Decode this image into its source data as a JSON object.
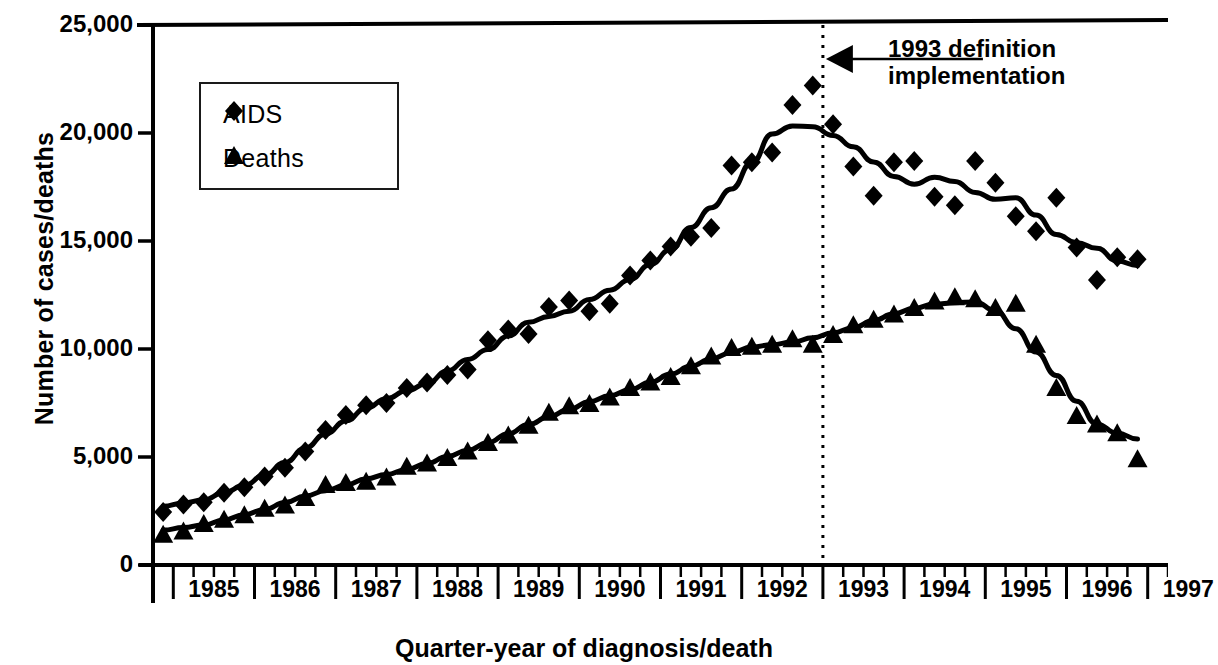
{
  "chart_data": {
    "type": "scatter",
    "title": "",
    "xlabel": "Quarter-year of diagnosis/death",
    "ylabel": "Number of cases/deaths",
    "ylim": [
      0,
      25000
    ],
    "yticks": [
      0,
      5000,
      10000,
      15000,
      20000,
      25000
    ],
    "ytick_labels": [
      "0",
      "5,000",
      "10,000",
      "15,000",
      "20,000",
      "25,000"
    ],
    "xlim": [
      1984.75,
      1997.25
    ],
    "xtick_labels": [
      "1985",
      "1986",
      "1987",
      "1988",
      "1989",
      "1990",
      "1991",
      "1992",
      "1993",
      "1994",
      "1995",
      "1996",
      "1997"
    ],
    "x_minor_ticks": "quarterly",
    "grid": false,
    "legend_position": "upper-left-inside",
    "annotations": [
      {
        "text_line1": "1993 definition",
        "text_line2": "implementation",
        "marker": "vertical dotted line with left arrow",
        "x_value": 1993.0
      }
    ],
    "x": [
      1984.875,
      1985.125,
      1985.375,
      1985.625,
      1985.875,
      1986.125,
      1986.375,
      1986.625,
      1986.875,
      1987.125,
      1987.375,
      1987.625,
      1987.875,
      1988.125,
      1988.375,
      1988.625,
      1988.875,
      1989.125,
      1989.375,
      1989.625,
      1989.875,
      1990.125,
      1990.375,
      1990.625,
      1990.875,
      1991.125,
      1991.375,
      1991.625,
      1991.875,
      1992.125,
      1992.375,
      1992.625,
      1992.875,
      1993.125,
      1993.375,
      1993.625,
      1993.875,
      1994.125,
      1994.375,
      1994.625,
      1994.875,
      1995.125,
      1995.375,
      1995.625,
      1995.875,
      1996.125,
      1996.375,
      1996.625,
      1996.875
    ],
    "series": [
      {
        "name": "AIDS",
        "marker": "diamond",
        "values": [
          2450,
          2800,
          2900,
          3350,
          3600,
          4100,
          4500,
          5250,
          6250,
          6950,
          7400,
          7500,
          8200,
          8450,
          8800,
          9050,
          10400,
          10900,
          10700,
          11950,
          12250,
          11750,
          12100,
          13400,
          14100,
          14750,
          15200,
          15600,
          18500,
          18650,
          19100,
          21300,
          22200,
          20400,
          18450,
          17100,
          18650,
          18700,
          17050,
          16650,
          18700,
          17700,
          16150,
          15450,
          17000,
          14700,
          13200,
          14250,
          14150
        ]
      },
      {
        "name": "Deaths",
        "marker": "triangle",
        "values": [
          1400,
          1550,
          1900,
          2100,
          2300,
          2600,
          2750,
          3100,
          3700,
          3800,
          3850,
          4050,
          4550,
          4700,
          4950,
          5250,
          5650,
          6000,
          6450,
          7050,
          7350,
          7450,
          7750,
          8200,
          8450,
          8700,
          9200,
          9650,
          10050,
          10100,
          10200,
          10450,
          10200,
          10650,
          11100,
          11350,
          11600,
          11900,
          12200,
          12400,
          12300,
          11900,
          12100,
          10200,
          8200,
          6900,
          6500,
          6100,
          4900
        ]
      }
    ],
    "trend_lines": [
      {
        "name": "AIDS smoothed trend"
      },
      {
        "name": "Deaths smoothed trend"
      }
    ]
  },
  "legend": {
    "items": [
      {
        "label": "AIDS",
        "marker": "diamond"
      },
      {
        "label": "Deaths",
        "marker": "triangle"
      }
    ]
  }
}
